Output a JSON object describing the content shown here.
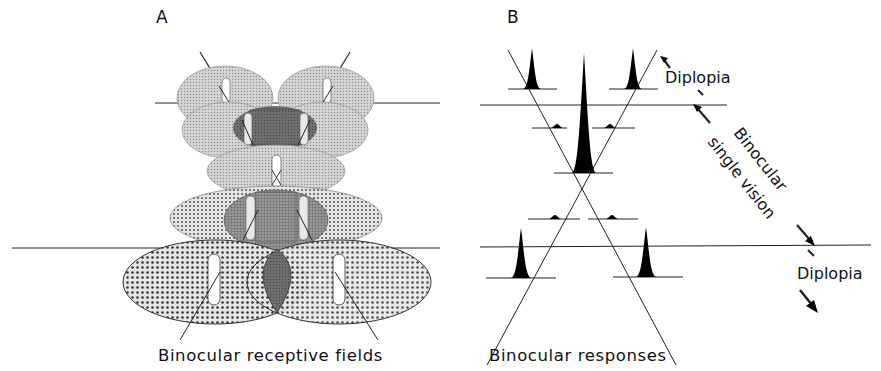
{
  "panels": {
    "a": {
      "letter": "A",
      "caption": "Binocular receptive fields"
    },
    "b": {
      "letter": "B",
      "caption": "Binocular responses",
      "annotations": {
        "diplopia_top": "Diplopia",
        "binocular_line1": "Binocular",
        "binocular_line2": "single vision",
        "diplopia_bottom": "Diplopia"
      }
    }
  },
  "colors": {
    "ink": "#111111",
    "light_fill": "#c8c8c8",
    "dotted_fill": "#bdbdbd",
    "dark_overlap": "#6a6a6a",
    "mid_overlap": "#8a8a8a"
  }
}
